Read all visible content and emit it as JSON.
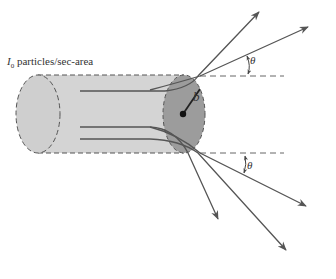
{
  "diagram": {
    "type": "scattering-cross-section",
    "incident_label": {
      "symbol": "I",
      "subscript": "0",
      "text": "particles/sec-area"
    },
    "impact_parameter_label": "b",
    "angle_labels": [
      "θ",
      "θ"
    ],
    "colors": {
      "cylinder_body": "#d4d4d4",
      "cylinder_end": "#9a9a9a",
      "lines": "#555555",
      "dashed": "#666666"
    }
  }
}
